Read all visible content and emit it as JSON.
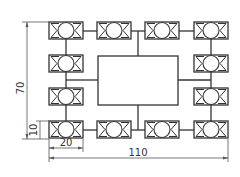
{
  "drawing": {
    "type": "technical-layout-drawing",
    "colors": {
      "line": "#333333",
      "dimension": "#555555",
      "background": "#ffffff"
    },
    "module_icon": "bearing-module-icon",
    "module_count": 14,
    "layout": {
      "top_row": 4,
      "bottom_row": 4,
      "left_column_middle": 2,
      "right_column_middle": 2,
      "center_block": "rectangle"
    }
  },
  "dimensions": {
    "overall_width": "110",
    "overall_height": "70",
    "module_width": "20",
    "module_height": "10"
  }
}
